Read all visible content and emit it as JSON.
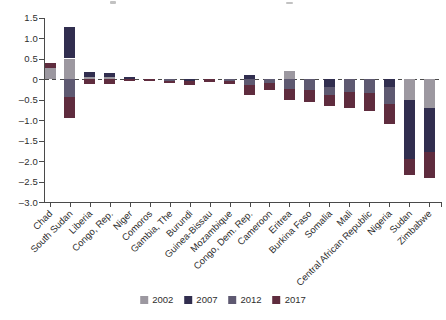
{
  "figure": {
    "background": "#ffffff",
    "axis_color": "#4a4a4a",
    "text_color": "#2e2e2e"
  },
  "chart_data": {
    "type": "bar",
    "stacked": true,
    "grid": false,
    "legend_position": "bottom",
    "ylim": [
      -3.0,
      1.5
    ],
    "zero_line": "dashed",
    "yticks": [
      {
        "label": "1.5",
        "value": 1.5
      },
      {
        "label": "1.0",
        "value": 1.0
      },
      {
        "label": "0.5",
        "value": 0.5
      },
      {
        "label": "0",
        "value": 0.0
      },
      {
        "label": "–0.5",
        "value": -0.5
      },
      {
        "label": "–1.0",
        "value": -1.0
      },
      {
        "label": "–1.5",
        "value": -1.5
      },
      {
        "label": "–2.0",
        "value": -2.0
      },
      {
        "label": "–2.5",
        "value": -2.5
      },
      {
        "label": "–3.0",
        "value": -3.0
      }
    ],
    "categories": [
      "Chad",
      "South Sudan",
      "Liberia",
      "Congo, Rep.",
      "Niger",
      "Comoros",
      "Gambia, The",
      "Burundi",
      "Guinea-Bissau",
      "Mozambique",
      "Congo, Dem. Rep.",
      "Cameroon",
      "Eritrea",
      "Burkina Faso",
      "Somalia",
      "Mali",
      "Central African Republic",
      "Nigeria",
      "Sudan",
      "Zimbabwe"
    ],
    "series": [
      {
        "name": "2002",
        "color": "#9c98a0",
        "values": [
          0.26,
          0.5,
          0.05,
          0.04,
          0,
          0,
          0,
          0,
          0,
          0,
          0,
          0,
          0.2,
          0,
          0,
          0,
          0,
          0,
          -0.5,
          -0.7
        ]
      },
      {
        "name": "2007",
        "color": "#312e4f",
        "values": [
          0,
          0.77,
          0.13,
          0.1,
          0.05,
          0,
          0,
          -0.05,
          0,
          0,
          0.1,
          0,
          0,
          0,
          -0.2,
          0,
          0,
          -0.2,
          -1.45,
          -1.08
        ]
      },
      {
        "name": "2012",
        "color": "#5e5971",
        "values": [
          0,
          -0.45,
          0,
          0,
          0,
          0,
          -0.04,
          0,
          0,
          -0.05,
          -0.15,
          -0.1,
          -0.25,
          -0.27,
          -0.2,
          -0.32,
          -0.35,
          -0.4,
          0,
          0
        ]
      },
      {
        "name": "2017",
        "color": "#5f2c3e",
        "values": [
          0.14,
          -0.5,
          -0.12,
          -0.12,
          -0.06,
          -0.06,
          -0.06,
          -0.09,
          -0.08,
          -0.07,
          -0.23,
          -0.16,
          -0.25,
          -0.28,
          -0.25,
          -0.38,
          -0.42,
          -0.5,
          -0.4,
          -0.64
        ]
      }
    ]
  }
}
